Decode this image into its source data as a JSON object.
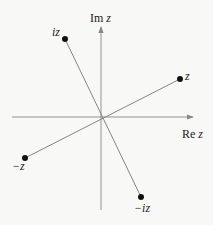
{
  "diagram": {
    "axes": {
      "x_label": "Re z",
      "x_label_prefix": "Re",
      "x_label_var": "z",
      "y_label": "Im z",
      "y_label_prefix": "Im",
      "y_label_var": "z",
      "origin": [
        101,
        117
      ]
    },
    "points": [
      {
        "id": "z",
        "label": "z",
        "x": 180,
        "y": 79
      },
      {
        "id": "iz",
        "label": "iz",
        "x": 65,
        "y": 39
      },
      {
        "id": "neg-z",
        "label": "−z",
        "x": 25,
        "y": 158
      },
      {
        "id": "neg-iz",
        "label": "−iz",
        "x": 141,
        "y": 197
      }
    ],
    "colors": {
      "line": "#777777",
      "axis": "#888888",
      "point": "#111111",
      "background": "#f8f8f6"
    }
  }
}
